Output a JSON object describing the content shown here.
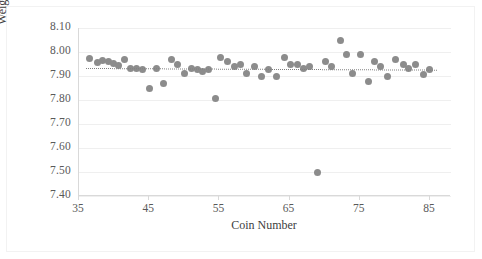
{
  "chart_data": {
    "type": "scatter",
    "title": "",
    "xlabel": "Coin Number",
    "ylabel": "Weight (gms)",
    "xlim": [
      35,
      88
    ],
    "ylim": [
      7.4,
      8.1
    ],
    "xticks": [
      35,
      45,
      55,
      65,
      75,
      85
    ],
    "yticks": [
      "8.10",
      "8.00",
      "7.90",
      "7.80",
      "7.70",
      "7.60",
      "7.50",
      "7.40"
    ],
    "ytick_values": [
      8.1,
      8.0,
      7.9,
      7.8,
      7.7,
      7.6,
      7.5,
      7.4
    ],
    "grid": true,
    "legend": "none",
    "marker_color": "#8c8c8c",
    "trendline": {
      "style": "dotted",
      "color": "#808080",
      "x_start": 36,
      "x_end": 86,
      "y_start": 7.932,
      "y_end": 7.925
    },
    "series": [
      {
        "name": "Coin Weight",
        "points": [
          [
            36.5,
            7.971
          ],
          [
            37.6,
            7.958
          ],
          [
            38.3,
            7.963
          ],
          [
            39.2,
            7.961
          ],
          [
            39.9,
            7.951
          ],
          [
            40.6,
            7.944
          ],
          [
            41.5,
            7.97
          ],
          [
            42.4,
            7.931
          ],
          [
            43.2,
            7.93
          ],
          [
            44.0,
            7.929
          ],
          [
            45.0,
            7.849
          ],
          [
            46.1,
            7.93
          ],
          [
            47.0,
            7.869
          ],
          [
            48.2,
            7.97
          ],
          [
            49.1,
            7.95
          ],
          [
            50.1,
            7.91
          ],
          [
            51.0,
            7.932
          ],
          [
            51.9,
            7.929
          ],
          [
            52.6,
            7.919
          ],
          [
            53.5,
            7.929
          ],
          [
            54.4,
            7.808
          ],
          [
            55.2,
            7.979
          ],
          [
            56.2,
            7.961
          ],
          [
            57.1,
            7.938
          ],
          [
            58.0,
            7.949
          ],
          [
            58.9,
            7.91
          ],
          [
            60.0,
            7.939
          ],
          [
            61.0,
            7.899
          ],
          [
            62.0,
            7.929
          ],
          [
            63.1,
            7.898
          ],
          [
            64.3,
            7.979
          ],
          [
            65.2,
            7.948
          ],
          [
            66.1,
            7.949
          ],
          [
            67.0,
            7.93
          ],
          [
            67.9,
            7.938
          ],
          [
            69.0,
            7.499
          ],
          [
            70.1,
            7.959
          ],
          [
            71.0,
            7.938
          ],
          [
            72.2,
            8.046
          ],
          [
            73.1,
            7.989
          ],
          [
            74.0,
            7.909
          ],
          [
            75.1,
            7.989
          ],
          [
            76.2,
            7.878
          ],
          [
            77.1,
            7.96
          ],
          [
            78.0,
            7.939
          ],
          [
            79.0,
            7.898
          ],
          [
            80.1,
            7.969
          ],
          [
            81.2,
            7.949
          ],
          [
            82.0,
            7.93
          ],
          [
            83.0,
            7.948
          ],
          [
            84.1,
            7.908
          ],
          [
            85.0,
            7.927
          ]
        ]
      }
    ]
  }
}
